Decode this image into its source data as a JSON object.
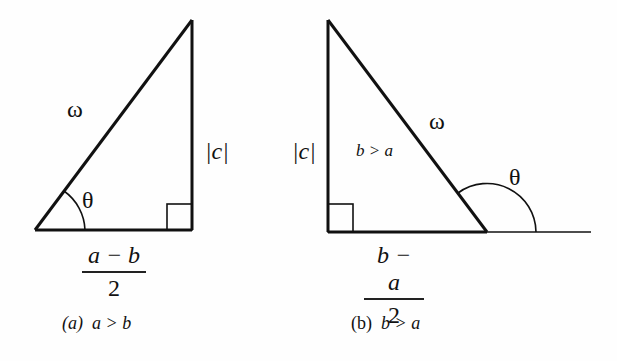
{
  "figure_a": {
    "hypotenuse_label": "ω",
    "vertical_label": "|c|",
    "angle_label": "θ",
    "base_numerator": "a − b",
    "base_denominator": "2",
    "caption_tag": "(a)",
    "caption_text": "a > b"
  },
  "figure_b": {
    "hypotenuse_label": "ω",
    "vertical_label": "|c|",
    "inner_label": "b > a",
    "angle_label": "θ",
    "base_numerator": "b − a",
    "base_denominator": "2",
    "caption_tag": "(b)",
    "caption_text": "b > a"
  },
  "colors": {
    "stroke": "#111111",
    "background": "#fefefe"
  }
}
